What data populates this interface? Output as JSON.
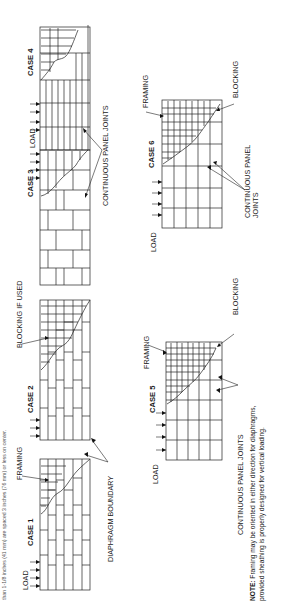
{
  "caption_fragment": "than 1-1/8 inches (41 mm) are spaced 3 inches (76 mm) or less on center.",
  "cases": [
    {
      "id": 1,
      "title": "CASE 1",
      "load_label": "LOAD",
      "callouts": [
        "FRAMING"
      ],
      "panel_layout": "staggered, long axis parallel to load"
    },
    {
      "id": 2,
      "title": "CASE 2",
      "load_label": "",
      "callouts": [
        "BLOCKING IF USED"
      ],
      "panel_layout": "staggered, long axis parallel to load"
    },
    {
      "id": 3,
      "title": "CASE 3",
      "load_label": "",
      "callouts": [],
      "panel_layout": "staggered, long axis perpendicular to load"
    },
    {
      "id": 4,
      "title": "CASE 4",
      "load_label": "LOAD",
      "callouts": [],
      "panel_layout": "staggered, long axis perpendicular to load"
    },
    {
      "id": 5,
      "title": "CASE 5",
      "load_label": "LOAD",
      "callouts": [
        "FRAMING",
        "BLOCKING"
      ],
      "panel_layout": "continuous joints both directions"
    },
    {
      "id": 6,
      "title": "CASE 6",
      "load_label": "LOAD",
      "callouts": [
        "FRAMING",
        "BLOCKING"
      ],
      "panel_layout": "continuous joints both directions"
    }
  ],
  "labels": {
    "diaphragm_boundary": "DIAPHRAGM BOUNDARY",
    "continuous_panel_joints": "CONTINUOUS PANEL JOINTS",
    "continuous_panel_joints_case6_line1": "CONTINUOUS PANEL",
    "continuous_panel_joints_case6_line2": "JOINTS",
    "load": "LOAD",
    "framing": "FRAMING",
    "blocking": "BLOCKING",
    "blocking_if_used": "BLOCKING IF USED"
  },
  "note": {
    "prefix": "NOTE:",
    "line1": " Framing may be oriented in either direction for diaphragms,",
    "line2": "provided sheathing is properly designed for vertical loading."
  },
  "colors": {
    "ink": "#1a1a1a",
    "background": "#ffffff",
    "caption": "#555555"
  }
}
